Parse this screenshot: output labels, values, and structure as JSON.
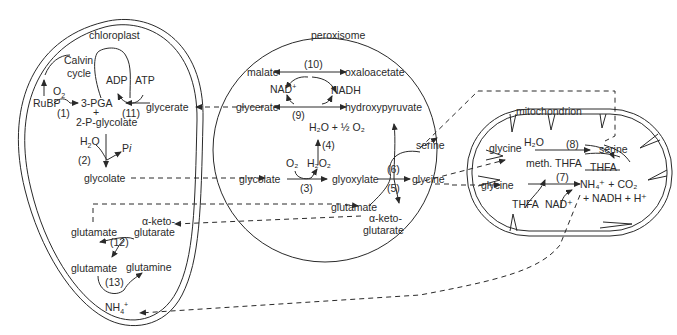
{
  "organelles": {
    "chloroplast": "chloroplast",
    "peroxisome": "peroxisome",
    "mitochondrion": "mitochondrion"
  },
  "chloroplast": {
    "calvin_1": "Calvin",
    "calvin_2": "cycle",
    "rubp": "RuBP",
    "o2": "O",
    "o2_sub": "2",
    "pga": "3-PGA",
    "plus": "+",
    "p_glycolate": "2-P-glycolate",
    "adp": "ADP",
    "atp": "ATP",
    "glycerate": "glycerate",
    "h2o_h": "H",
    "h2o_sub": "2",
    "h2o_o": "O",
    "pi": "P",
    "pi_i": "i",
    "glycolate": "glycolate",
    "akg_1": "α-keto-",
    "akg_2": "glutarate",
    "glutamate_1": "glutamate",
    "glutamate_2": "glutamate",
    "glutamine": "glutamine",
    "nh4": "NH",
    "nh4_sub": "4",
    "nh4_sup": "+"
  },
  "peroxisome": {
    "malate": "malate",
    "oxaloacetate": "oxaloacetate",
    "nad": "NAD",
    "nad_sup": "+",
    "nadh": "NADH",
    "glycerate": "glycerate",
    "hydroxypyruvate": "hydroxypyruvate",
    "water_half_o2": "H₂O + ½ O₂",
    "o2": "O₂",
    "h2o2": "H₂O₂",
    "glycolate": "glycolate",
    "glyoxylate": "glyoxylate",
    "glycine": "glycine",
    "serine": "serine",
    "glutamate": "glutamate",
    "akg_1": "α-keto-",
    "akg_2": "glutarate"
  },
  "mitochondrion": {
    "glycine_1": "glycine",
    "glycine_2": "glycine",
    "h2o": "H₂O",
    "serine": "serine",
    "meth_thfa": "meth. THFA",
    "thfa_1": "THFA",
    "thfa_2": "THFA",
    "nad": "NAD⁺",
    "products_1": "NH₄⁺ + CO₂",
    "products_2": "+ NADH + H⁺"
  },
  "reaction_numbers": {
    "r1": "(1)",
    "r2": "(2)",
    "r3": "(3)",
    "r4": "(4)",
    "r5": "(5)",
    "r6": "(6)",
    "r7": "(7)",
    "r8": "(8)",
    "r9": "(9)",
    "r10": "(10)",
    "r11": "(11)",
    "r12": "(12)",
    "r13": "(13)"
  },
  "colors": {
    "ink": "#2a2a2a",
    "background": "#ffffff"
  }
}
